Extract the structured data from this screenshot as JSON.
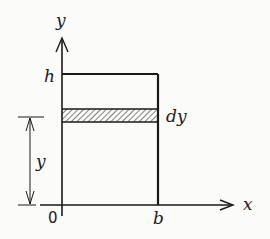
{
  "diagram": {
    "type": "rectangle-area-strip",
    "axes": {
      "x_label": "x",
      "y_label": "y",
      "origin_label": "0"
    },
    "rectangle": {
      "width_label": "b",
      "height_label": "h"
    },
    "strip": {
      "thickness_label": "dy",
      "hatched": true
    },
    "dimension": {
      "label": "y",
      "from": "x-axis",
      "to": "strip"
    },
    "colors": {
      "ink": "#1a1a1a",
      "background": "#fbfbf9"
    }
  }
}
